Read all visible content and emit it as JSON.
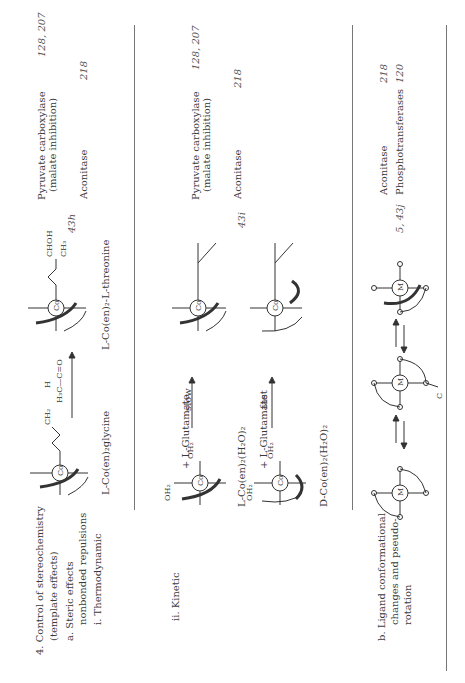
{
  "section4": {
    "heading_line1": "4.  Control of stereochemistry",
    "heading_line2": "(template effects)",
    "a_line1": "a.  Steric effects",
    "a_line2": "nonbonded repulsions",
    "i_label": "i.  Thermodynamic",
    "ii_label": "ii.  Kinetic",
    "b_line1": "b.  Ligand conformational",
    "b_line2": "changes and pseudo-",
    "b_line3": "rotation"
  },
  "rows": [
    {
      "reactant_label": "L-Co(en)₂glycine",
      "reagent": "H₃C—C=O",
      "reagent_h": "H",
      "product_label": "L-Co(en)₂-L-threonine",
      "figure_ref": "43h",
      "enzymes": [
        {
          "name_line1": "Pyruvate carboxylase",
          "name_line2": "(malate inhibition)",
          "refs": "128, 207"
        },
        {
          "name_line1": "Aconitase",
          "name_line2": "",
          "refs": "218"
        }
      ]
    },
    {
      "reactant_label": "L-Co(en)₂(H₂O)₂",
      "reagent": "+ L-Glutamate",
      "arrow_label": "slow",
      "figure_ref": "",
      "enzymes": [
        {
          "name_line1": "Pyruvate carboxylase",
          "name_line2": "(malate inhibition)",
          "refs": "128, 207"
        },
        {
          "name_line1": "Aconitase",
          "name_line2": "",
          "refs": "218"
        }
      ]
    },
    {
      "reactant_label": "D-Co(en)₂(H₂O)₂",
      "reagent": "+ L-Glutamate",
      "arrow_label": "fast",
      "figure_ref": "43i"
    },
    {
      "figure_ref": "5, 43j",
      "enzymes": [
        {
          "name_line1": "Aconitase",
          "refs": "218"
        },
        {
          "name_line1": "Phosphotransferases",
          "refs": "120"
        }
      ]
    }
  ],
  "atoms": {
    "cobalt": "Co",
    "metal": "M",
    "nitrogen": "N",
    "oxygen": "O",
    "water": "OH₂",
    "chohh": "CHOH",
    "ch3": "CH₃",
    "ch2": "CH₂",
    "carbon": "C"
  }
}
